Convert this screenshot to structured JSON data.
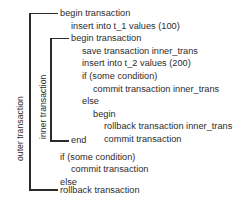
{
  "diagram": {
    "type": "nested-transaction-pseudocode",
    "background_color": "#ffffff",
    "text_color": "#2b2b2b",
    "scopes": [
      {
        "id": "outer",
        "label": "outer transaction",
        "orientation": "vertical-rotated-ccw",
        "spans_lines": [
          0,
          13
        ]
      },
      {
        "id": "inner",
        "label": "inner transaction",
        "orientation": "vertical-rotated-ccw",
        "spans_lines": [
          2,
          10
        ]
      }
    ],
    "code_lines": [
      {
        "indent": 0,
        "text": "begin transaction"
      },
      {
        "indent": 1,
        "text": "insert into t_1 values (100)"
      },
      {
        "indent": 1,
        "text": "begin transaction"
      },
      {
        "indent": 2,
        "text": "save transaction inner_trans"
      },
      {
        "indent": 2,
        "text": "insert into t_2 values (200)"
      },
      {
        "indent": 2,
        "text": "if (some condition)"
      },
      {
        "indent": 3,
        "text": "commit transaction inner_trans"
      },
      {
        "indent": 2,
        "text": "else"
      },
      {
        "indent": 3,
        "text": "begin"
      },
      {
        "indent": 4,
        "text": "rollback transaction inner_trans"
      },
      {
        "indent": 4,
        "text": "commit transaction"
      },
      {
        "indent": 1,
        "text": "end"
      },
      {
        "indent": 0,
        "text": "if (some condition)"
      },
      {
        "indent": 1,
        "text": "commit transaction"
      },
      {
        "indent": 0,
        "text": "else"
      },
      {
        "indent": 0,
        "text": "rollback transaction"
      }
    ]
  }
}
